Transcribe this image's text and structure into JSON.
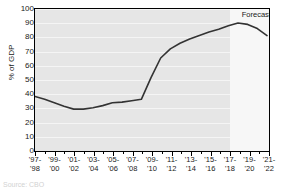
{
  "chart_data": {
    "type": "line",
    "title": "",
    "xlabel": "",
    "ylabel": "% of GDP",
    "ylim": [
      0,
      100
    ],
    "ytick_step": 10,
    "yticks": [
      "0",
      "10",
      "20",
      "30",
      "40",
      "50",
      "60",
      "70",
      "80",
      "90",
      "100"
    ],
    "grid": "horizontal",
    "legend": "none",
    "categories": [
      "'97-'98",
      "'98-'99",
      "'99-'00",
      "'00-'01",
      "'01-'02",
      "'02-'03",
      "'03-'04",
      "'04-'05",
      "'05-'06",
      "'06-'07",
      "'07-'08",
      "'08-'09",
      "'09-'10",
      "'10-'11",
      "'11-'12",
      "'12-'13",
      "'13-'14",
      "'14-'15",
      "'15-'16",
      "'16-'17",
      "'17-'18",
      "'18-'19",
      "'19-'20",
      "'20-'21",
      "'21-'22"
    ],
    "tick_labels": [
      {
        "line1": "'97-",
        "line2": "'98"
      },
      {
        "line1": "'99-",
        "line2": "'00"
      },
      {
        "line1": "'01-",
        "line2": "'02"
      },
      {
        "line1": "'03-",
        "line2": "'04"
      },
      {
        "line1": "'05-",
        "line2": "'06"
      },
      {
        "line1": "'07-",
        "line2": "'08"
      },
      {
        "line1": "'09-",
        "line2": "'10"
      },
      {
        "line1": "'11-",
        "line2": "'12"
      },
      {
        "line1": "'13-",
        "line2": "'14"
      },
      {
        "line1": "'15-",
        "line2": "'16"
      },
      {
        "line1": "'17-",
        "line2": "'18"
      },
      {
        "line1": "'19-",
        "line2": "'20"
      },
      {
        "line1": "'21-",
        "line2": "'22"
      }
    ],
    "values": [
      37.5,
      35.5,
      33.0,
      30.5,
      28.5,
      28.5,
      29.5,
      31.0,
      33.0,
      33.5,
      34.5,
      35.5,
      51.0,
      65.0,
      71.5,
      75.5,
      78.5,
      81.0,
      83.5,
      85.5,
      88.0,
      90.0,
      89.0,
      86.0,
      81.0
    ],
    "annotations": [
      {
        "text": "Forecasts",
        "x_category": "'18-'19",
        "y": 96
      }
    ],
    "forecast_start_category": "'17-'18",
    "series_color": "#333333",
    "plot_background": "#e6e6e6",
    "forecast_background": "#f7f7f7",
    "gridline_color": "#f5f5f5"
  },
  "caption": {
    "source": "Source: CBO"
  }
}
